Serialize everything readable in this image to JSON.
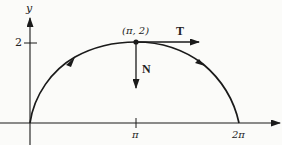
{
  "diagram": {
    "title": "",
    "axes": {
      "x_label": "",
      "y_label": "y",
      "x_ticks": [
        {
          "label": "π",
          "value": 3.14159
        },
        {
          "label": "2π",
          "value": 6.28318
        }
      ],
      "y_ticks": [
        {
          "label": "2",
          "value": 2
        }
      ]
    },
    "curve": {
      "description": "Arch from origin to (2π, 0) with maximum at (π, 2)",
      "start": [
        0,
        0
      ],
      "peak": [
        3.14159,
        2
      ],
      "end": [
        6.28318,
        0
      ],
      "direction_arrows": 2
    },
    "point": {
      "label": "(π, 2)"
    },
    "vectors": [
      {
        "name": "T",
        "label": "T",
        "meaning": "unit tangent",
        "direction": "right"
      },
      {
        "name": "N",
        "label": "N",
        "meaning": "unit normal",
        "direction": "down"
      }
    ],
    "colors": {
      "ink": "#1a1a1a",
      "background": "#fbfbf9"
    }
  }
}
